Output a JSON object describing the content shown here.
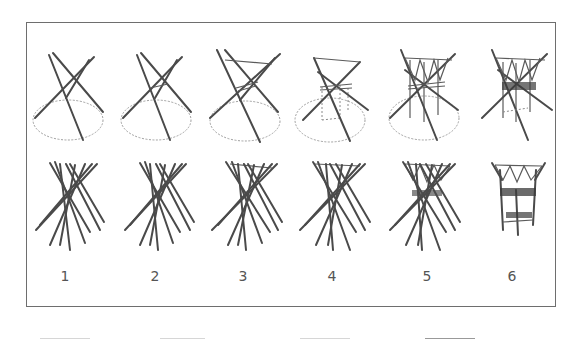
{
  "figure": {
    "stages": [
      {
        "label": "1",
        "x": 65
      },
      {
        "label": "2",
        "x": 155
      },
      {
        "label": "3",
        "x": 243
      },
      {
        "label": "4",
        "x": 332
      },
      {
        "label": "5",
        "x": 427
      },
      {
        "label": "6",
        "x": 512
      }
    ],
    "colors": {
      "frame": "#6e6e6e",
      "stick": "#4a4a4a",
      "ground": "#9a9a9a",
      "label": "#555555"
    }
  }
}
